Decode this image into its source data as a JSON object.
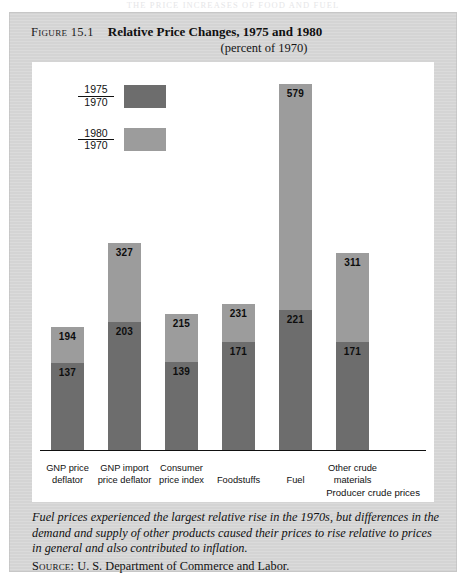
{
  "page": {
    "running_head": "THE PRICE INCREASES OF FOOD AND FUEL",
    "page_number": "431"
  },
  "figure": {
    "label": "Figure 15.1",
    "title": "Relative Price Changes, 1975 and 1980",
    "subtitle": "(percent of 1970)",
    "axis_note": "Producer crude prices",
    "caption": "Fuel prices experienced the largest relative rise in the 1970s, but differences in the demand and supply of other products caused their prices to rise relative to prices in general and also contributed to inflation.",
    "source_label": "Source:",
    "source_text": "U. S. Department of Commerce and Labor."
  },
  "legend": {
    "items": [
      {
        "numerator": "1975",
        "denominator": "1970",
        "color": "#6d6d6d",
        "series": "1975"
      },
      {
        "numerator": "1980",
        "denominator": "1970",
        "color": "#9c9c9c",
        "series": "1980"
      }
    ]
  },
  "chart_data": {
    "type": "bar",
    "stacked_display": true,
    "title": "Relative Price Changes, 1975 and 1980",
    "subtitle": "(percent of 1970)",
    "xlabel": "Producer crude prices",
    "ylabel": "",
    "ylim": [
      0,
      579
    ],
    "grid": false,
    "legend_position": "top-left",
    "categories": [
      "GNP price deflator",
      "GNP import price deflator",
      "Consumer price index",
      "Foodstuffs",
      "Fuel",
      "Other crude materials"
    ],
    "category_lines": [
      [
        "GNP price",
        "deflator"
      ],
      [
        "GNP import",
        "price deflator"
      ],
      [
        "Consumer",
        "price index"
      ],
      [
        "Foodstuffs",
        ""
      ],
      [
        "Fuel",
        ""
      ],
      [
        "Other crude",
        "materials"
      ]
    ],
    "series": [
      {
        "name": "1975/1970",
        "color": "#6d6d6d",
        "values": [
          137,
          203,
          139,
          171,
          221,
          171
        ]
      },
      {
        "name": "1980/1970",
        "color": "#9c9c9c",
        "values": [
          194,
          327,
          215,
          231,
          579,
          311
        ]
      }
    ]
  }
}
